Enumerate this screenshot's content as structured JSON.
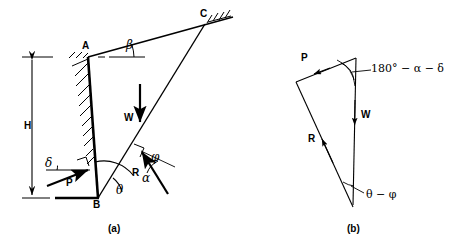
{
  "figure": {
    "captions": [
      {
        "text": "(a)",
        "x": 113,
        "y": 224
      },
      {
        "text": "(b)",
        "x": 351,
        "y": 224
      }
    ]
  },
  "panel_a": {
    "name": "wall-wedge-diagram",
    "points": [
      {
        "id": "A",
        "label": "A",
        "x": 88,
        "y": 57,
        "label_x": 82,
        "label_y": 41
      },
      {
        "id": "B",
        "label": "B",
        "x": 98,
        "y": 198,
        "label_x": 93,
        "label_y": 200
      },
      {
        "id": "C",
        "label": "C",
        "x": 205,
        "y": 24,
        "label_x": 200,
        "label_y": 9
      }
    ],
    "dimensions": [
      {
        "id": "H",
        "label": "H",
        "label_x": 24,
        "label_y": 121,
        "line_x": 32,
        "y_top": 57,
        "y_bottom": 198
      }
    ],
    "forces": [
      {
        "id": "W",
        "label": "W",
        "label_x": 124,
        "label_y": 113,
        "x": 140,
        "y_tail": 84,
        "y_head": 124,
        "direction": "down"
      },
      {
        "id": "P",
        "label": "P",
        "label_x": 66,
        "label_y": 178,
        "tail_x": 47,
        "tail_y": 186,
        "head_x": 90,
        "head_y": 170,
        "direction": "up-right"
      },
      {
        "id": "R",
        "label": "R",
        "label_x": 132,
        "label_y": 168,
        "tail_x": 166,
        "tail_y": 192,
        "head_x": 141,
        "head_y": 152,
        "direction": "up-left"
      }
    ],
    "angles": [
      {
        "id": "beta",
        "label": "β",
        "label_x": 126,
        "label_y": 45,
        "vertex": "A",
        "between": "horizontal-and-slope"
      },
      {
        "id": "delta",
        "label": "δ",
        "label_x": 47,
        "label_y": 163,
        "vertex": "P-tail",
        "between": "horizontal-and-P"
      },
      {
        "id": "phi",
        "label": "φ",
        "label_x": 152,
        "label_y": 157,
        "vertex": "failure-plane",
        "between": "normal-and-R"
      },
      {
        "id": "alpha",
        "label": "α",
        "label_x": 142,
        "label_y": 178,
        "vertex": "B",
        "between": "wall-back-and-failure-plane"
      },
      {
        "id": "theta",
        "label": "θ",
        "label_x": 117,
        "label_y": 188,
        "vertex": "B",
        "between": "base-and-failure-plane"
      }
    ]
  },
  "panel_b": {
    "name": "force-triangle-diagram",
    "vertices": {
      "top_right": {
        "x": 356,
        "y": 58
      },
      "top_left": {
        "x": 296,
        "y": 82
      },
      "bottom": {
        "x": 353,
        "y": 207
      }
    },
    "forces": [
      {
        "id": "P",
        "label": "P",
        "label_x": 302,
        "label_y": 60,
        "direction": "up-left"
      },
      {
        "id": "W",
        "label": "W",
        "label_x": 361,
        "label_y": 115,
        "direction": "down"
      },
      {
        "id": "R",
        "label": "R",
        "label_x": 309,
        "label_y": 139,
        "direction": "up-left"
      }
    ],
    "angles": [
      {
        "id": "top-angle",
        "label": "180° − α − δ",
        "label_x": 371,
        "label_y": 56,
        "vertex": "top_right"
      },
      {
        "id": "bottom-angle",
        "label": "θ − φ",
        "label_x": 365,
        "label_y": 188,
        "vertex": "bottom"
      }
    ]
  },
  "style": {
    "ink": "#000000",
    "background": "#ffffff"
  }
}
